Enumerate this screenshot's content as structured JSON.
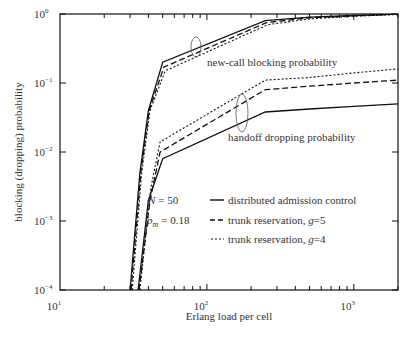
{
  "chart_data": {
    "type": "line",
    "title": "",
    "xlabel": "Erlang load per cell",
    "ylabel": "blocking (dropping) probability",
    "xscale": "log",
    "yscale": "log",
    "xlim": [
      10,
      2000
    ],
    "ylim": [
      0.0001,
      1
    ],
    "grid": false,
    "x_ticks": [
      {
        "value": 10,
        "label": "10",
        "exp": "1"
      },
      {
        "value": 100,
        "label": "10",
        "exp": "2"
      },
      {
        "value": 1000,
        "label": "10",
        "exp": "3"
      }
    ],
    "y_ticks": [
      {
        "value": 1,
        "label": "10",
        "exp": "0"
      },
      {
        "value": 0.1,
        "label": "10",
        "exp": "−1"
      },
      {
        "value": 0.01,
        "label": "10",
        "exp": "−2"
      },
      {
        "value": 0.001,
        "label": "10",
        "exp": "−3"
      },
      {
        "value": 0.0001,
        "label": "10",
        "exp": "−4"
      }
    ],
    "legend": {
      "position": "center-left inside",
      "params": [
        {
          "symbol": "N",
          "value": "= 50"
        },
        {
          "symbol": "p",
          "sub": "m",
          "value": "= 0.18"
        }
      ],
      "entries": [
        {
          "style": "solid",
          "label": "distributed admission control"
        },
        {
          "style": "dashed",
          "label": "trunk reservation, g=5"
        },
        {
          "style": "dotted",
          "label": "trunk reservation, g=4"
        }
      ]
    },
    "annotations": [
      {
        "text": "new-call blocking probability",
        "x": 90,
        "y": 0.3
      },
      {
        "text": "handoff dropping probability",
        "x": 180,
        "y": 0.025
      }
    ],
    "series": [
      {
        "name": "new-call blocking, distributed admission control",
        "style": "solid",
        "x": [
          30,
          35,
          40,
          50,
          250,
          500,
          1000,
          2000
        ],
        "y": [
          0.0001,
          0.005,
          0.04,
          0.2,
          0.8,
          0.9,
          0.95,
          1.0
        ]
      },
      {
        "name": "new-call blocking, trunk reservation g=5",
        "style": "dashed",
        "x": [
          30.5,
          35.5,
          40.5,
          51,
          255,
          500,
          1000,
          2000
        ],
        "y": [
          0.0001,
          0.005,
          0.04,
          0.17,
          0.75,
          0.88,
          0.94,
          1.0
        ]
      },
      {
        "name": "new-call blocking, trunk reservation g=4",
        "style": "dotted",
        "x": [
          31,
          36,
          41,
          52,
          260,
          500,
          1000,
          2000
        ],
        "y": [
          0.0001,
          0.005,
          0.04,
          0.15,
          0.7,
          0.85,
          0.93,
          0.98
        ]
      },
      {
        "name": "handoff dropping, distributed admission control",
        "style": "solid",
        "x": [
          34,
          40,
          50,
          250,
          500,
          1000,
          2000
        ],
        "y": [
          0.0001,
          0.002,
          0.008,
          0.038,
          0.042,
          0.046,
          0.05
        ]
      },
      {
        "name": "handoff dropping, trunk reservation g=5",
        "style": "dashed",
        "x": [
          34.5,
          41,
          48,
          250,
          500,
          1000,
          2000
        ],
        "y": [
          0.0001,
          0.002,
          0.01,
          0.08,
          0.09,
          0.1,
          0.11
        ]
      },
      {
        "name": "handoff dropping, trunk reservation g=4",
        "style": "dotted",
        "x": [
          35,
          41.5,
          48,
          250,
          500,
          1000,
          2000
        ],
        "y": [
          0.0001,
          0.003,
          0.014,
          0.11,
          0.12,
          0.14,
          0.16
        ]
      }
    ]
  }
}
